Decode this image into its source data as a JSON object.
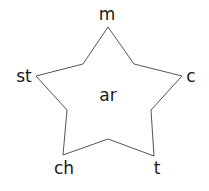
{
  "diagram": {
    "type": "word-star",
    "center": {
      "text": "ar"
    },
    "points": [
      {
        "position": "top",
        "text": "m"
      },
      {
        "position": "right",
        "text": "c"
      },
      {
        "position": "bottom-right",
        "text": "t"
      },
      {
        "position": "bottom-left",
        "text": "ch"
      },
      {
        "position": "left",
        "text": "st"
      }
    ],
    "stroke_color": "#555555",
    "text_color": "#1a1a1a"
  }
}
